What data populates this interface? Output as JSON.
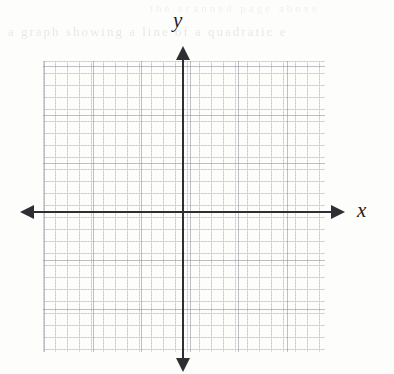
{
  "figure": {
    "kind": "blank-cartesian-coordinate-plane",
    "background_color": "#fdfdfc"
  },
  "axes": {
    "x_label": "x",
    "y_label": "y",
    "axis_color": "#2e2e33",
    "x_arrow_left_icon": "arrow-left-icon",
    "x_arrow_right_icon": "arrow-right-icon",
    "y_arrow_up_icon": "arrow-up-icon",
    "y_arrow_down_icon": "arrow-down-icon"
  },
  "grid": {
    "style": "dotted",
    "minor_color": "#8c8c96",
    "major_color": "#787884",
    "minor_spacing_px": 12,
    "major_spacing_px": 48.5,
    "columns_major": 6,
    "rows_major": 6
  },
  "artifacts": {
    "ghost_text_top": "a graph showing a line of a quadratic e",
    "ghost_text_upper": "the scanned page above"
  },
  "chart_data": {
    "type": "scatter",
    "title": "",
    "subtitle": "",
    "xlabel": "x",
    "ylabel": "y",
    "xlim": [
      -3,
      3
    ],
    "ylim": [
      -3,
      3
    ],
    "xticks": [
      -3,
      -2,
      -1,
      0,
      1,
      2,
      3
    ],
    "yticks": [
      -3,
      -2,
      -1,
      0,
      1,
      2,
      3
    ],
    "xtick_labels": [
      "",
      "",
      "",
      "",
      "",
      "",
      ""
    ],
    "ytick_labels": [
      "",
      "",
      "",
      "",
      "",
      "",
      ""
    ],
    "grid": true,
    "legend": null,
    "series": [],
    "x": [],
    "y": [],
    "annotations": [],
    "note": "Empty coordinate grid with no plotted data; axes unlabeled numerically."
  }
}
